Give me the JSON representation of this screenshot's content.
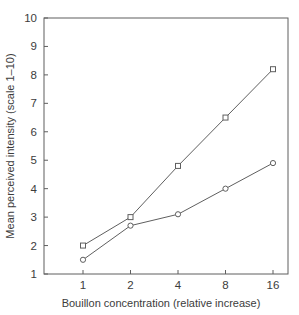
{
  "figure": {
    "background": "#ffffff"
  },
  "chart_data": {
    "type": "line",
    "x_categories": [
      "1",
      "2",
      "4",
      "8",
      "16"
    ],
    "x_scale": "log2-category",
    "series": [
      {
        "name": "square-series",
        "marker": "square",
        "values": [
          2.0,
          3.0,
          4.8,
          6.5,
          8.2
        ]
      },
      {
        "name": "circle-series",
        "marker": "circle",
        "values": [
          1.5,
          2.7,
          3.1,
          4.0,
          4.9
        ]
      }
    ],
    "title": "",
    "xlabel": "Bouillon concentration (relative increase)",
    "ylabel": "Mean perceived intensity (scale 1–10)",
    "ylim": [
      1,
      10
    ],
    "yticks": [
      1,
      2,
      3,
      4,
      5,
      6,
      7,
      8,
      9,
      10
    ],
    "grid": false,
    "legend": "none",
    "colors": {
      "line": "#5f5f5f",
      "text": "#3c3c3c",
      "marker_fill": "#ffffff"
    }
  }
}
